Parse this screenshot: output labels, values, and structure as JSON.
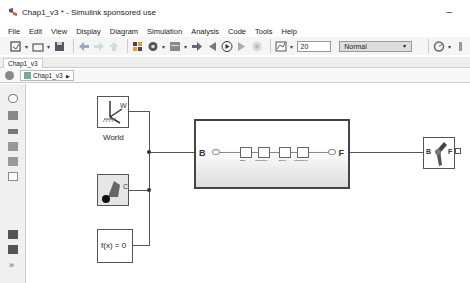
{
  "window": {
    "title": "Chap1_v3 * - Simulink sponsored use",
    "minimize": "–"
  },
  "menu": [
    "File",
    "Edit",
    "View",
    "Display",
    "Diagram",
    "Simulation",
    "Analysis",
    "Code",
    "Tools",
    "Help"
  ],
  "toolbar": {
    "stop_time": "20",
    "sim_mode": "Normal"
  },
  "tabs": [
    {
      "label": "Chap1_v3"
    }
  ],
  "breadcrumb": {
    "label": "Chap1_v3",
    "arrow": "▶"
  },
  "blocks": {
    "world": {
      "label": "World",
      "port": "W"
    },
    "config": {
      "port": "C"
    },
    "solver": {
      "label": "f(x) = 0"
    },
    "subsystem": {
      "port_in": "B",
      "port_out": "F",
      "inner": [
        "Base",
        "Translation",
        "Body1",
        "Translation1"
      ]
    },
    "joint": {
      "port_in": "B",
      "port_out": "F"
    }
  }
}
